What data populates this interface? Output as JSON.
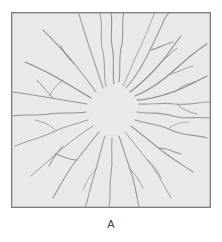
{
  "figure": {
    "label": "A",
    "panel_title": ""
  },
  "colors": {
    "page_background": "#ffffff",
    "specimen_fill": "#e9e9e9",
    "specimen_border": "#808080",
    "crack_line": "#8a8a8a",
    "crack_line_dark": "#777777",
    "label_text": "#3a3a3a"
  },
  "chart_data": {
    "type": "diagram",
    "title": "A",
    "panel": {
      "shape": "square",
      "x": 11,
      "y": 12,
      "width": 200,
      "height": 196,
      "fill": "#e9e9e9",
      "stroke": "#808080",
      "stroke_width": 1.2
    },
    "origin": {
      "x": 100,
      "y": 96,
      "clear_radius": 26
    },
    "cracks": [
      {
        "id": "c01",
        "angle_deg": -90,
        "d": "M103,72 C101,60 104,48 101,34 C99,22 102,12 100,0"
      },
      {
        "id": "c02",
        "angle_deg": -84,
        "d": "M108,70 C110,58 107,46 111,32 C113,20 110,10 113,0"
      },
      {
        "id": "c03",
        "angle_deg": -96,
        "d": "M95,74 C92,62 95,50 91,36 C89,24 92,14 89,2"
      },
      {
        "id": "c04",
        "angle_deg": -70,
        "d": "M115,76 C124,66 130,56 136,44 C142,32 148,20 154,6 C157,2 158,0 159,0"
      },
      {
        "id": "c05",
        "angle_deg": -62,
        "d": "M119,80 C130,72 138,64 147,54 C156,44 162,34 170,24"
      },
      {
        "id": "c06",
        "angle_deg": -55,
        "d": "M124,84 C134,80 144,74 154,66 C164,58 172,50 182,42 C188,38 192,34 196,32"
      },
      {
        "id": "c07",
        "angle_deg": -40,
        "d": "M126,88 C138,88 150,84 162,80 C174,76 184,70 196,64"
      },
      {
        "id": "c08",
        "angle_deg": -18,
        "d": "M128,92 C140,93 152,90 164,92 C176,94 186,90 198,90"
      },
      {
        "id": "c09",
        "angle_deg": 0,
        "d": "M126,100 C138,102 150,100 162,104 C174,108 184,104 198,106"
      },
      {
        "id": "c10",
        "angle_deg": 12,
        "d": "M124,108 C136,112 148,112 160,118 C172,124 182,122 196,126"
      },
      {
        "id": "c11",
        "angle_deg": 28,
        "d": "M120,114 C130,122 140,130 150,138 C160,146 170,152 182,160"
      },
      {
        "id": "c12",
        "angle_deg": 45,
        "d": "M114,120 C122,130 130,140 138,150 C146,160 152,172 160,186"
      },
      {
        "id": "c13",
        "angle_deg": 62,
        "d": "M108,124 C112,136 116,148 120,160 C124,172 126,184 128,196"
      },
      {
        "id": "c14",
        "angle_deg": 80,
        "d": "M101,126 C100,138 102,150 100,162 C98,174 100,186 98,196"
      },
      {
        "id": "c15",
        "angle_deg": 95,
        "d": "M94,124 C90,136 88,148 84,160 C80,172 78,184 74,196"
      },
      {
        "id": "c16",
        "angle_deg": 118,
        "d": "M88,120 C80,130 72,140 64,150 C56,160 50,172 42,186"
      },
      {
        "id": "c17",
        "angle_deg": 140,
        "d": "M82,114 C72,120 62,128 52,136 C42,144 32,154 20,164"
      },
      {
        "id": "c18",
        "angle_deg": 160,
        "d": "M77,108 C66,112 54,114 42,120 C30,126 18,128 4,134"
      },
      {
        "id": "c19",
        "angle_deg": 178,
        "d": "M75,100 C62,102 50,100 38,102 C26,104 14,102 2,104"
      },
      {
        "id": "c20",
        "angle_deg": 196,
        "d": "M76,92 C64,90 52,88 40,86 C28,84 16,82 2,80"
      },
      {
        "id": "c21",
        "angle_deg": 214,
        "d": "M80,86 C70,80 60,74 50,68 C40,62 28,56 14,50"
      },
      {
        "id": "c22",
        "angle_deg": 232,
        "d": "M85,80 C78,70 70,60 62,50 C54,40 44,30 32,18"
      },
      {
        "id": "c23",
        "angle_deg": 250,
        "d": "M92,76 C88,64 84,52 80,40 C76,28 72,16 68,2"
      },
      {
        "id": "c24",
        "angle_deg": -75,
        "d": "M112,74 C118,62 122,50 128,38 C134,26 138,14 144,0"
      }
    ],
    "branches": [
      {
        "id": "b01",
        "parent": "c04",
        "d": "M140,38 C148,36 154,32 162,30"
      },
      {
        "id": "b02",
        "parent": "c05",
        "d": "M150,50 C156,46 160,40 166,36"
      },
      {
        "id": "b03",
        "parent": "c06",
        "d": "M160,62 C168,60 174,56 182,54"
      },
      {
        "id": "b04",
        "parent": "c07",
        "d": "M164,80 C170,74 176,72 184,70"
      },
      {
        "id": "b05",
        "parent": "c08",
        "d": "M166,92 C172,98 178,100 186,102"
      },
      {
        "id": "b06",
        "parent": "c10",
        "d": "M158,116 C164,112 170,110 178,110"
      },
      {
        "id": "b07",
        "parent": "c11",
        "d": "M148,136 C156,136 162,140 170,142"
      },
      {
        "id": "b08",
        "parent": "c12",
        "d": "M136,148 C142,152 146,158 150,166"
      },
      {
        "id": "b09",
        "parent": "c16",
        "d": "M66,148 C58,148 52,144 44,142"
      },
      {
        "id": "b10",
        "parent": "c17",
        "d": "M52,134 C46,140 42,146 38,154"
      },
      {
        "id": "b11",
        "parent": "c18",
        "d": "M44,118 C38,112 32,110 24,108"
      },
      {
        "id": "b12",
        "parent": "c20",
        "d": "M42,86 C36,80 32,74 26,68"
      },
      {
        "id": "b13",
        "parent": "c21",
        "d": "M52,68 C46,72 42,78 38,84"
      },
      {
        "id": "b14",
        "parent": "c22",
        "d": "M64,52 C58,48 54,42 50,34"
      },
      {
        "id": "b15",
        "parent": "c13",
        "d": "M118,156 C124,162 128,168 132,176"
      },
      {
        "id": "b16",
        "parent": "c15",
        "d": "M86,156 C80,162 76,168 72,178"
      }
    ],
    "xlabel": "",
    "ylabel": "",
    "grid": false,
    "legend": false
  }
}
